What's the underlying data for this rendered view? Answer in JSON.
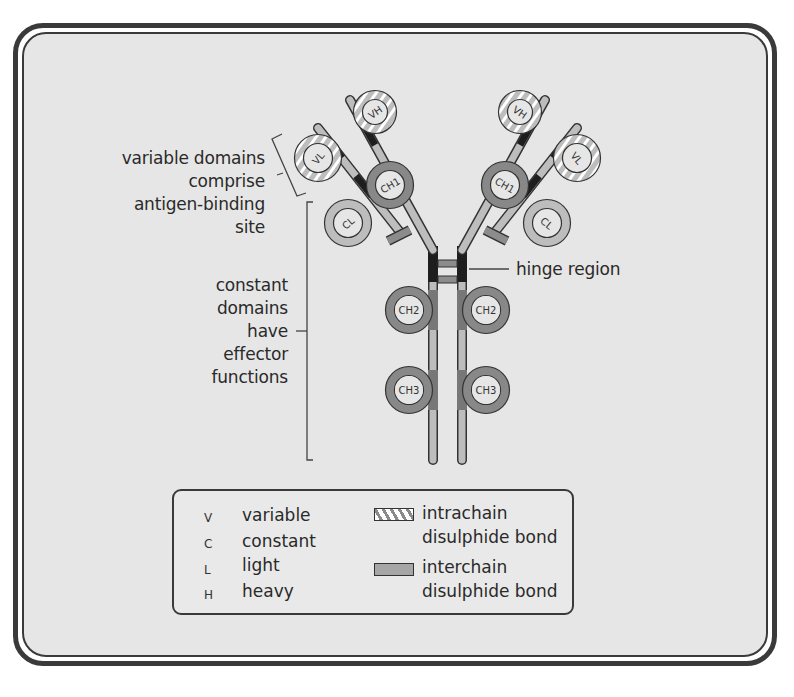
{
  "diagram": {
    "domains": {
      "left_arm": [
        "VH",
        "VL",
        "CH1",
        "CL"
      ],
      "right_arm": [
        "VH",
        "VL",
        "CH1",
        "CL"
      ],
      "stem_left": [
        "CH2",
        "CH3"
      ],
      "stem_right": [
        "CH2",
        "CH3"
      ]
    },
    "labels": {
      "variable": [
        "variable domains",
        "comprise",
        "antigen-binding",
        "site"
      ],
      "constant": [
        "constant",
        "domains",
        "have",
        "effector",
        "functions"
      ],
      "hinge": "hinge region"
    },
    "legend": {
      "abbreviations": [
        {
          "abbr": "V",
          "meaning": "variable"
        },
        {
          "abbr": "C",
          "meaning": "constant"
        },
        {
          "abbr": "L",
          "meaning": "light"
        },
        {
          "abbr": "H",
          "meaning": "heavy"
        }
      ],
      "bonds": [
        {
          "name": "intrachain",
          "desc": "disulphide bond",
          "pattern": "hatched"
        },
        {
          "name": "interchain",
          "desc": "disulphide bond",
          "pattern": "solid-grey"
        }
      ]
    },
    "colors": {
      "background": "#e6e6e6",
      "border": "#3a3a3a",
      "chain_light": "#bdbdbd",
      "chain_dark": "#8c8c8c",
      "chain_black": "#1e1e1e"
    }
  }
}
